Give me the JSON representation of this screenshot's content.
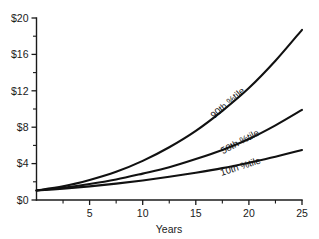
{
  "chart_data": {
    "type": "line",
    "title": "",
    "subtitle": "",
    "xlabel": "Years",
    "ylabel": "",
    "xlim": [
      0,
      25
    ],
    "ylim": [
      0,
      20
    ],
    "grid": false,
    "legend_position": "inline-along-curves",
    "x_ticks_major": [
      5,
      10,
      15,
      20,
      25
    ],
    "x_tick_labels": [
      "5",
      "10",
      "15",
      "20",
      "25"
    ],
    "x_ticks_minor": [
      2.5,
      7.5,
      12.5,
      17.5,
      22.5
    ],
    "y_ticks_major": [
      0,
      4,
      8,
      12,
      16,
      20
    ],
    "y_tick_labels": [
      "$0",
      "$4",
      "$8",
      "$12",
      "$16",
      "$20"
    ],
    "y_ticks_minor": [
      2,
      6,
      10,
      14,
      18
    ],
    "x": [
      0,
      2.5,
      5,
      7.5,
      10,
      12.5,
      15,
      17.5,
      20,
      22.5,
      25
    ],
    "series": [
      {
        "name": "90th %tile",
        "label": "90th %tile",
        "values": [
          1.05,
          1.5,
          2.2,
          3.1,
          4.3,
          5.8,
          7.6,
          9.8,
          12.3,
          15.3,
          18.7
        ],
        "label_x": 18.2,
        "label_y": 10.4,
        "label_rotation": -41
      },
      {
        "name": "50th %tile",
        "label": "50th %tile",
        "values": [
          1.05,
          1.35,
          1.75,
          2.25,
          2.9,
          3.6,
          4.5,
          5.5,
          6.7,
          8.2,
          9.9
        ],
        "label_x": 19.3,
        "label_y": 6.1,
        "label_rotation": -28
      },
      {
        "name": "10th %tile",
        "label": "10th %tile",
        "values": [
          1.05,
          1.25,
          1.5,
          1.8,
          2.15,
          2.55,
          3.0,
          3.5,
          4.1,
          4.75,
          5.5
        ],
        "label_x": 19.3,
        "label_y": 3.35,
        "label_rotation": -18
      }
    ]
  },
  "axes": {
    "x_title": "Years"
  },
  "colors": {
    "curve": "#111111",
    "axis": "#1a1a1a",
    "background": "#ffffff"
  }
}
